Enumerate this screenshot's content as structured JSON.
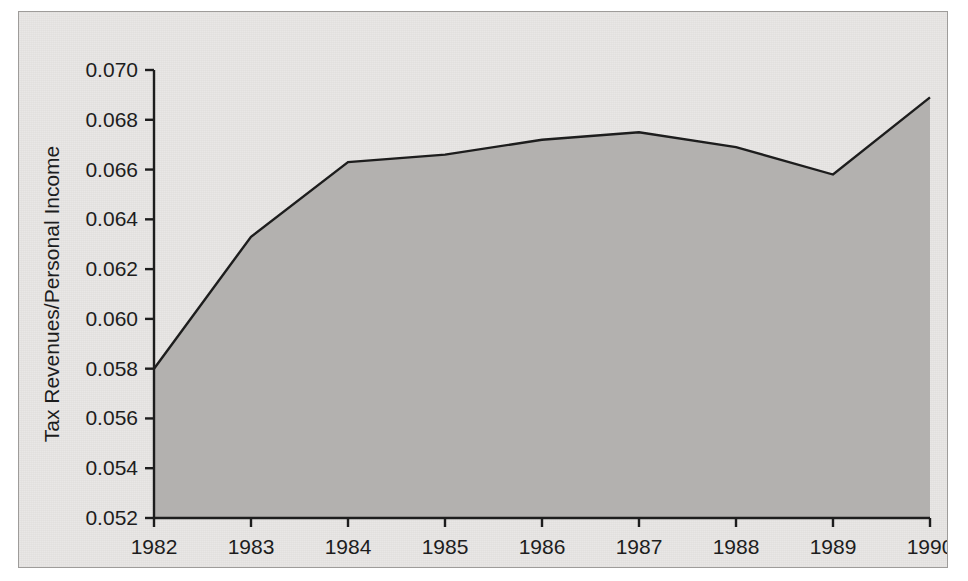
{
  "chart_data": {
    "type": "area",
    "title": "",
    "subtitle": "",
    "xlabel": "",
    "ylabel": "Tax Revenues/Personal Income",
    "categories": [
      "1982",
      "1983",
      "1984",
      "1985",
      "1986",
      "1987",
      "1988",
      "1989",
      "1990"
    ],
    "x": [
      1982,
      1983,
      1984,
      1985,
      1986,
      1987,
      1988,
      1989,
      1990
    ],
    "values": [
      0.058,
      0.0633,
      0.0663,
      0.0666,
      0.0672,
      0.0675,
      0.0669,
      0.0658,
      0.0689
    ],
    "series": [
      {
        "name": "Tax Revenues/Personal Income",
        "values": [
          0.058,
          0.0633,
          0.0663,
          0.0666,
          0.0672,
          0.0675,
          0.0669,
          0.0658,
          0.0689
        ]
      }
    ],
    "ylim": [
      0.052,
      0.07
    ],
    "xlim": [
      1982,
      1990
    ],
    "ytick_labels": [
      "0.052",
      "0.054",
      "0.056",
      "0.058",
      "0.060",
      "0.062",
      "0.064",
      "0.066",
      "0.068",
      "0.070"
    ],
    "ytick_values": [
      0.052,
      0.054,
      0.056,
      0.058,
      0.06,
      0.062,
      0.064,
      0.066,
      0.068,
      0.07
    ],
    "xtick_labels": [
      "1982",
      "1983",
      "1984",
      "1985",
      "1986",
      "1987",
      "1988",
      "1989",
      "1990"
    ],
    "grid": false,
    "legend": null,
    "legend_position": "none",
    "annotations": [],
    "colors": {
      "panel_background": "#e9e7e5",
      "panel_border": "#9e9c9a",
      "area_fill": "#b3b1af",
      "line": "#1d1d1d",
      "axis": "#1d1d1d",
      "text": "#1d1d1d"
    }
  }
}
